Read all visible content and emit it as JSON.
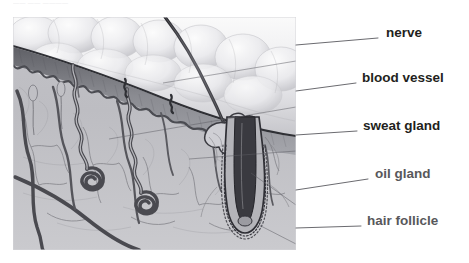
{
  "page": {
    "width": 469,
    "height": 263,
    "background": "#ffffff",
    "faint_header_text": "—— ——  ————"
  },
  "figure": {
    "kind": "anatomical-illustration",
    "style": "grayscale pencil/airbrush rendering",
    "panel": {
      "x": 13,
      "y": 17,
      "width": 283,
      "height": 233
    }
  },
  "colors": {
    "label_text_dark": "#231f20",
    "label_text_gray": "#58585b",
    "leader_line": "#6b6b70",
    "epidermis_surface": "#d8d8dc",
    "epidermis_band": "#6f7076",
    "dermis": "#b9b9bd",
    "vessel": "#4a4a50",
    "hair": "#2b2b30",
    "panel_background": "#c9c9cd"
  },
  "labels": [
    {
      "id": "nerve",
      "text": "nerve",
      "weight": "bold",
      "color": "#231f20",
      "x": 386,
      "y": 32,
      "leader": {
        "from_x": 296,
        "from_y": 45,
        "to_x": 378,
        "to_y": 38
      },
      "pointer_in_image": {
        "x": 150,
        "y": 65
      }
    },
    {
      "id": "blood-vessel",
      "text": "blood vessel",
      "weight": "bold",
      "color": "#231f20",
      "x": 362,
      "y": 77,
      "leader": {
        "from_x": 296,
        "from_y": 91,
        "to_x": 356,
        "to_y": 83
      },
      "pointer_in_image": {
        "x": 100,
        "y": 120
      }
    },
    {
      "id": "sweat-gland",
      "text": "sweat gland",
      "weight": "bold",
      "color": "#231f20",
      "x": 363,
      "y": 125,
      "leader": {
        "from_x": 296,
        "from_y": 135,
        "to_x": 357,
        "to_y": 131
      },
      "pointer_in_image": {
        "x": 180,
        "y": 140
      }
    },
    {
      "id": "oil-gland",
      "text": "oil gland",
      "weight": "bold",
      "color": "#58585b",
      "x": 375,
      "y": 173,
      "leader": {
        "from_x": 296,
        "from_y": 190,
        "to_x": 368,
        "to_y": 179
      },
      "pointer_in_image": {
        "x": 230,
        "y": 158
      }
    },
    {
      "id": "hair-follicle",
      "text": "hair follicle",
      "weight": "bold",
      "color": "#58585b",
      "x": 367,
      "y": 220,
      "leader": {
        "from_x": 296,
        "from_y": 228,
        "to_x": 361,
        "to_y": 226
      },
      "pointer_in_image": {
        "x": 245,
        "y": 210
      }
    }
  ],
  "anatomy_parts": [
    "epidermis surface lobules",
    "dermal papillae band",
    "dermis connective tissue",
    "capillary network",
    "sweat gland coil (left)",
    "sweat gland coil (right)",
    "sweat duct",
    "hair shaft",
    "hair follicle bulb",
    "sebaceous (oil) gland"
  ]
}
